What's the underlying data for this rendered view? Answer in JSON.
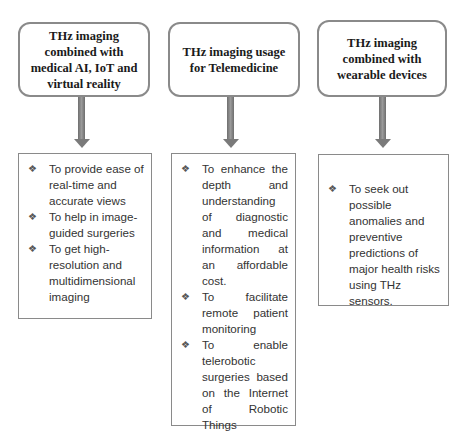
{
  "columns": [
    {
      "title": "THz imaging combined with medical AI, IoT and virtual reality",
      "items": [
        "To provide ease of real-time and accurate views",
        "To help in image-guided surgeries",
        "To get high-resolution and multidimensional imaging"
      ]
    },
    {
      "title": "THz imaging usage for Telemedicine",
      "items": [
        "To enhance the depth and understanding of diagnostic and medical information at an affordable cost.",
        "To facilitate remote patient monitoring",
        "To enable telerobotic surgeries based on the Internet of Robotic Things"
      ]
    },
    {
      "title": "THz imaging combined with wearable devices",
      "items": [
        "To seek out possible anomalies and preventive predictions of major health risks using THz sensors."
      ]
    }
  ],
  "bullet_icon": "❖",
  "colors": {
    "border": "#8a8a8a",
    "arrow": "#7a7a7a",
    "text": "#333333"
  }
}
